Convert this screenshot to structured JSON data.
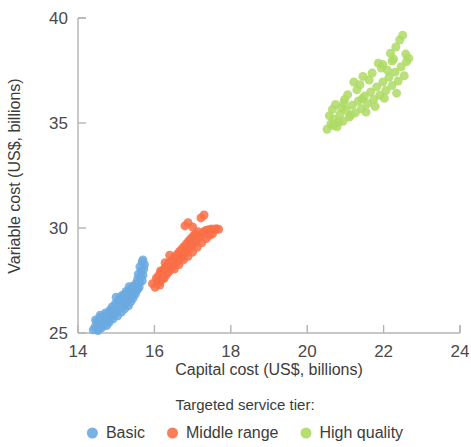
{
  "chart_data": {
    "type": "scatter",
    "title": "",
    "xlabel": "Capital cost (US$, billions)",
    "ylabel": "Variable cost (US$, billions)",
    "xlim": [
      14,
      24
    ],
    "ylim": [
      25,
      40
    ],
    "xticks": [
      14,
      16,
      18,
      20,
      22,
      24
    ],
    "yticks": [
      25,
      30,
      35,
      40
    ],
    "xtick_labels": [
      "14",
      "16",
      "18",
      "20",
      "22",
      "24"
    ],
    "ytick_labels": [
      "25",
      "30",
      "35",
      "40"
    ],
    "grid": false,
    "legend_position": "bottom",
    "legend_title": "Targeted service tier:",
    "marker_size": 9,
    "marker_opacity": 0.85,
    "series": [
      {
        "name": "Basic",
        "color": "#6aa9e0",
        "points": [
          [
            14.4,
            25.15
          ],
          [
            14.45,
            25.3
          ],
          [
            14.52,
            25.12
          ],
          [
            14.58,
            25.42
          ],
          [
            14.62,
            25.25
          ],
          [
            14.5,
            25.55
          ],
          [
            14.7,
            25.48
          ],
          [
            14.66,
            25.7
          ],
          [
            14.75,
            25.35
          ],
          [
            14.8,
            25.62
          ],
          [
            14.58,
            25.85
          ],
          [
            14.88,
            25.78
          ],
          [
            14.72,
            25.95
          ],
          [
            14.95,
            25.9
          ],
          [
            14.84,
            26.1
          ],
          [
            15.02,
            26.05
          ],
          [
            14.9,
            26.25
          ],
          [
            15.1,
            26.18
          ],
          [
            14.98,
            26.4
          ],
          [
            15.18,
            26.32
          ],
          [
            15.06,
            26.52
          ],
          [
            15.24,
            26.45
          ],
          [
            15.12,
            26.62
          ],
          [
            15.3,
            26.58
          ],
          [
            15.0,
            26.7
          ],
          [
            15.2,
            26.75
          ],
          [
            15.36,
            26.68
          ],
          [
            15.28,
            26.88
          ],
          [
            15.42,
            26.8
          ],
          [
            15.34,
            27.0
          ],
          [
            15.48,
            26.95
          ],
          [
            15.4,
            27.12
          ],
          [
            15.54,
            27.05
          ],
          [
            15.46,
            27.25
          ],
          [
            15.6,
            27.18
          ],
          [
            15.52,
            27.35
          ],
          [
            15.62,
            27.4
          ],
          [
            15.56,
            27.55
          ],
          [
            15.68,
            27.48
          ],
          [
            15.64,
            27.68
          ],
          [
            15.58,
            27.8
          ],
          [
            15.7,
            27.75
          ],
          [
            15.66,
            27.95
          ],
          [
            15.72,
            28.05
          ],
          [
            15.62,
            28.15
          ],
          [
            15.74,
            28.25
          ],
          [
            15.68,
            28.38
          ],
          [
            15.7,
            28.48
          ],
          [
            14.55,
            25.2
          ],
          [
            14.68,
            25.4
          ],
          [
            14.82,
            25.52
          ],
          [
            14.92,
            25.68
          ],
          [
            15.04,
            25.82
          ],
          [
            15.14,
            26.0
          ],
          [
            15.22,
            26.15
          ],
          [
            15.32,
            26.3
          ],
          [
            15.38,
            26.48
          ],
          [
            15.44,
            26.65
          ],
          [
            15.5,
            26.85
          ],
          [
            15.56,
            27.08
          ],
          [
            14.46,
            25.62
          ],
          [
            14.6,
            25.75
          ],
          [
            14.76,
            25.88
          ],
          [
            14.86,
            26.02
          ],
          [
            15.08,
            26.62
          ],
          [
            15.16,
            26.8
          ],
          [
            15.26,
            26.98
          ],
          [
            15.34,
            27.2
          ]
        ]
      },
      {
        "name": "Middle range",
        "color": "#f96f47",
        "points": [
          [
            15.95,
            27.35
          ],
          [
            16.02,
            27.18
          ],
          [
            16.08,
            27.45
          ],
          [
            16.14,
            27.28
          ],
          [
            16.2,
            27.55
          ],
          [
            16.1,
            27.72
          ],
          [
            16.26,
            27.62
          ],
          [
            16.18,
            27.88
          ],
          [
            16.32,
            27.78
          ],
          [
            16.24,
            28.02
          ],
          [
            16.38,
            27.92
          ],
          [
            16.3,
            28.15
          ],
          [
            16.44,
            28.08
          ],
          [
            16.36,
            28.28
          ],
          [
            16.5,
            28.2
          ],
          [
            16.42,
            28.4
          ],
          [
            16.56,
            28.32
          ],
          [
            16.48,
            28.52
          ],
          [
            16.62,
            28.45
          ],
          [
            16.54,
            28.62
          ],
          [
            16.68,
            28.55
          ],
          [
            16.6,
            28.75
          ],
          [
            16.74,
            28.68
          ],
          [
            16.66,
            28.88
          ],
          [
            16.8,
            28.8
          ],
          [
            16.72,
            29.0
          ],
          [
            16.86,
            28.92
          ],
          [
            16.78,
            29.12
          ],
          [
            16.92,
            29.05
          ],
          [
            16.84,
            29.25
          ],
          [
            16.98,
            29.18
          ],
          [
            16.9,
            29.38
          ],
          [
            17.04,
            29.3
          ],
          [
            16.96,
            29.5
          ],
          [
            17.1,
            29.42
          ],
          [
            17.02,
            29.62
          ],
          [
            17.16,
            29.55
          ],
          [
            17.08,
            29.72
          ],
          [
            17.22,
            29.65
          ],
          [
            17.14,
            29.82
          ],
          [
            17.28,
            29.78
          ],
          [
            17.34,
            29.88
          ],
          [
            17.42,
            29.92
          ],
          [
            17.5,
            29.95
          ],
          [
            17.56,
            29.9
          ],
          [
            17.62,
            29.96
          ],
          [
            17.68,
            29.94
          ],
          [
            17.3,
            30.62
          ],
          [
            17.22,
            30.48
          ],
          [
            16.88,
            30.25
          ],
          [
            16.8,
            30.1
          ],
          [
            17.0,
            30.05
          ],
          [
            16.05,
            27.6
          ],
          [
            16.16,
            27.95
          ],
          [
            16.28,
            28.35
          ],
          [
            16.4,
            28.7
          ],
          [
            16.52,
            28.05
          ],
          [
            16.64,
            28.25
          ],
          [
            16.76,
            28.48
          ],
          [
            16.88,
            28.65
          ],
          [
            17.0,
            28.85
          ],
          [
            17.12,
            29.08
          ],
          [
            17.24,
            29.3
          ],
          [
            17.36,
            29.5
          ],
          [
            17.44,
            29.65
          ],
          [
            17.52,
            29.72
          ],
          [
            16.12,
            27.42
          ],
          [
            16.22,
            27.7
          ]
        ]
      },
      {
        "name": "High quality",
        "color": "#adda63",
        "points": [
          [
            20.52,
            34.7
          ],
          [
            20.62,
            34.95
          ],
          [
            20.7,
            35.18
          ],
          [
            20.78,
            34.82
          ],
          [
            20.86,
            35.42
          ],
          [
            20.94,
            35.08
          ],
          [
            21.02,
            35.62
          ],
          [
            21.1,
            35.28
          ],
          [
            21.18,
            35.85
          ],
          [
            21.26,
            35.48
          ],
          [
            21.34,
            36.05
          ],
          [
            21.42,
            35.68
          ],
          [
            21.5,
            36.28
          ],
          [
            21.58,
            35.92
          ],
          [
            21.66,
            36.48
          ],
          [
            21.74,
            36.12
          ],
          [
            21.82,
            36.72
          ],
          [
            21.9,
            36.32
          ],
          [
            21.98,
            36.95
          ],
          [
            22.06,
            36.55
          ],
          [
            22.14,
            37.18
          ],
          [
            22.22,
            36.78
          ],
          [
            22.3,
            37.42
          ],
          [
            22.38,
            37.0
          ],
          [
            22.46,
            37.68
          ],
          [
            22.54,
            37.25
          ],
          [
            22.5,
            39.18
          ],
          [
            22.42,
            38.95
          ],
          [
            22.18,
            38.32
          ],
          [
            22.26,
            38.05
          ],
          [
            21.86,
            37.85
          ],
          [
            21.94,
            37.62
          ],
          [
            21.7,
            37.38
          ],
          [
            21.62,
            37.05
          ],
          [
            21.38,
            36.82
          ],
          [
            21.3,
            36.58
          ],
          [
            21.06,
            36.35
          ],
          [
            20.98,
            36.12
          ],
          [
            20.74,
            35.88
          ],
          [
            20.66,
            35.65
          ],
          [
            22.6,
            37.92
          ],
          [
            22.66,
            38.08
          ],
          [
            22.32,
            38.62
          ],
          [
            22.1,
            37.52
          ],
          [
            21.46,
            37.22
          ],
          [
            21.22,
            36.95
          ],
          [
            20.9,
            35.72
          ],
          [
            20.58,
            35.35
          ],
          [
            21.54,
            35.52
          ],
          [
            21.78,
            35.78
          ],
          [
            22.02,
            36.18
          ],
          [
            22.34,
            36.42
          ],
          [
            20.82,
            35.05
          ],
          [
            21.14,
            35.38
          ],
          [
            21.98,
            37.78
          ],
          [
            22.22,
            37.95
          ],
          [
            20.68,
            34.88
          ],
          [
            20.96,
            35.95
          ],
          [
            21.44,
            36.15
          ],
          [
            22.58,
            38.28
          ]
        ]
      }
    ]
  },
  "legend": {
    "title": "Targeted service tier:",
    "items": [
      {
        "label": "Basic",
        "color": "#6aa9e0",
        "marker": "circle-marker"
      },
      {
        "label": "Middle range",
        "color": "#f96f47",
        "marker": "circle-marker"
      },
      {
        "label": "High quality",
        "color": "#adda63",
        "marker": "circle-marker"
      }
    ]
  },
  "axes": {
    "x_title": "Capital cost (US$, billions)",
    "y_title": "Variable cost (US$, billions)"
  }
}
